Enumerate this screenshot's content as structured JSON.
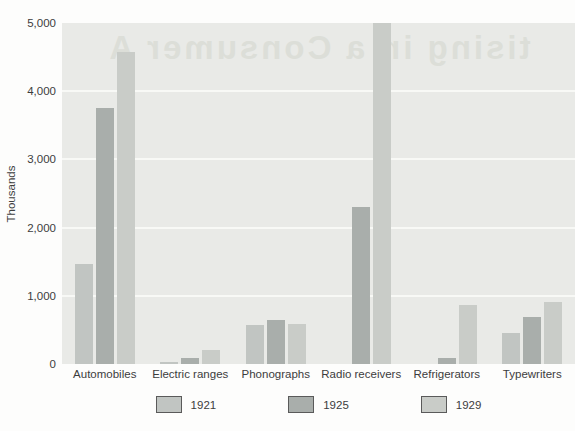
{
  "watermark": {
    "text": "tising in a Consumer A"
  },
  "chart_data": {
    "type": "bar",
    "title": "",
    "xlabel": "",
    "ylabel": "Thousands",
    "categories": [
      "Automobiles",
      "Electric ranges",
      "Phonographs",
      "Radio receivers",
      "Refrigerators",
      "Typewriters"
    ],
    "series": [
      {
        "name": "1921",
        "color": "#c1c5c2",
        "values": [
          1470,
          25,
          575,
          0,
          0,
          450
        ]
      },
      {
        "name": "1925",
        "color": "#a9aeab",
        "values": [
          3760,
          90,
          645,
          2300,
          85,
          695
        ]
      },
      {
        "name": "1929",
        "color": "#c9ccc8",
        "values": [
          4580,
          205,
          590,
          5000,
          870,
          915
        ]
      }
    ],
    "ylim": [
      0,
      5000
    ],
    "yticks": [
      {
        "value": 0,
        "label": "0"
      },
      {
        "value": 1000,
        "label": "1,000"
      },
      {
        "value": 2000,
        "label": "2,000"
      },
      {
        "value": 3000,
        "label": "3,000"
      },
      {
        "value": 4000,
        "label": "4,000"
      },
      {
        "value": 5000,
        "label": "5,000"
      }
    ],
    "grid": true,
    "grid_color": "#f8f9f6",
    "plot_bg": "#e9eae7",
    "legend_position": "bottom"
  }
}
